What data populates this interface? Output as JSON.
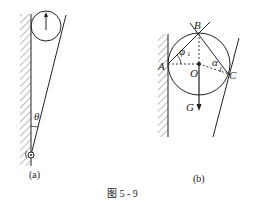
{
  "figure": {
    "caption": "图 5 - 9",
    "panels": [
      {
        "id": "a",
        "label": "(a)",
        "elements": [
          "wall",
          "wheel",
          "inclined-rod",
          "pivot"
        ],
        "angle_label": "θ"
      },
      {
        "id": "b",
        "label": "(b)",
        "points": {
          "A": "A",
          "B": "B",
          "C": "C",
          "O": "O"
        },
        "force_label": "G",
        "angle_labels": {
          "phi": "φ",
          "phi_sub": "1",
          "alpha": "α"
        }
      }
    ]
  },
  "colors": {
    "stroke": "#222222",
    "background": "#ffffff"
  }
}
